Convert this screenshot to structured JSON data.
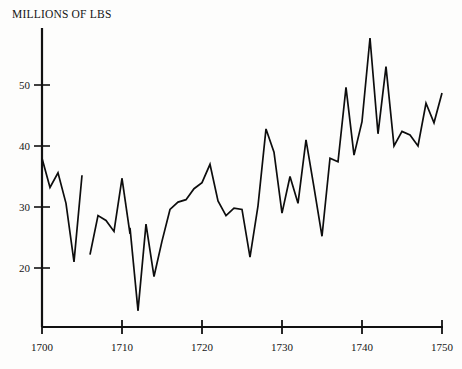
{
  "chart": {
    "title": "MILLIONS OF LBS",
    "axis": {
      "x_ticks": [
        "1700",
        "1710",
        "1720",
        "1730",
        "1740",
        "1750"
      ],
      "y_ticks": [
        "20",
        "30",
        "40",
        "50"
      ]
    }
  },
  "chart_data": {
    "type": "line",
    "title": "MILLIONS OF LBS",
    "xlabel": "",
    "ylabel": "MILLIONS OF LBS",
    "xlim": [
      1699,
      1751
    ],
    "ylim": [
      11,
      60
    ],
    "xticks": [
      1700,
      1710,
      1720,
      1730,
      1740,
      1750
    ],
    "yticks": [
      20,
      30,
      40,
      50
    ],
    "grid": false,
    "legend": null,
    "series": [
      {
        "name": "imports",
        "x": [
          1700,
          1701,
          1702,
          1703,
          1704,
          1705
        ],
        "values": [
          38.0,
          33.2,
          35.6,
          30.6,
          21.0,
          35.2
        ]
      },
      {
        "name": "imports",
        "x": [
          1706,
          1707,
          1708,
          1709,
          1710
        ],
        "values": [
          22.2,
          28.6,
          27.8,
          26.0,
          34.7
        ]
      },
      {
        "name": "imports",
        "x": [
          1710,
          1711
        ],
        "values": [
          34.7,
          25.6
        ]
      },
      {
        "name": "imports",
        "x": [
          1711,
          1712
        ],
        "values": [
          26.6,
          13.0
        ]
      },
      {
        "name": "imports",
        "x": [
          1712,
          1713,
          1714,
          1715,
          1716,
          1717,
          1718,
          1719,
          1720,
          1721,
          1722,
          1723,
          1724,
          1725,
          1726,
          1727,
          1728,
          1729,
          1730,
          1731,
          1732,
          1733,
          1734,
          1735,
          1736,
          1737,
          1738,
          1739,
          1740,
          1741,
          1742,
          1743,
          1744,
          1745,
          1746,
          1747,
          1748,
          1749,
          1750
        ],
        "values": [
          13.0,
          27.2,
          18.6,
          24.4,
          29.6,
          30.8,
          31.2,
          33.0,
          34.0,
          37.0,
          31.0,
          28.6,
          29.8,
          29.6,
          21.8,
          30.2,
          42.8,
          39.0,
          29.0,
          35.0,
          30.6,
          41.0,
          33.2,
          25.2,
          38.0,
          37.4,
          49.6,
          38.5,
          44.0,
          57.7,
          42.0,
          53.0,
          40.0,
          42.4,
          41.8,
          40.0,
          47.0,
          43.8,
          48.7
        ]
      }
    ]
  }
}
